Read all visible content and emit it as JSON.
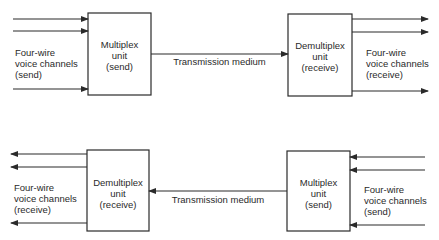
{
  "diagram": {
    "top_link": {
      "left_box": [
        "Multiplex",
        "unit",
        "(send)"
      ],
      "right_box": [
        "Demultiplex",
        "unit",
        "(receive)"
      ],
      "medium_label": "Transmission medium",
      "left_channels": [
        "Four-wire",
        "voice channels",
        "(send)"
      ],
      "right_channels": [
        "Four-wire",
        "voice channels",
        "(receive)"
      ],
      "direction": "left-to-right"
    },
    "bottom_link": {
      "left_box": [
        "Demultiplex",
        "unit",
        "(receive)"
      ],
      "right_box": [
        "Multiplex",
        "unit",
        "(send)"
      ],
      "medium_label": "Transmission medium",
      "left_channels": [
        "Four-wire",
        "voice channels",
        "(receive)"
      ],
      "right_channels": [
        "Four-wire",
        "voice channels",
        "(send)"
      ],
      "direction": "right-to-left"
    }
  },
  "colors": {
    "line": "#2a2a2a",
    "background": "#ffffff"
  }
}
